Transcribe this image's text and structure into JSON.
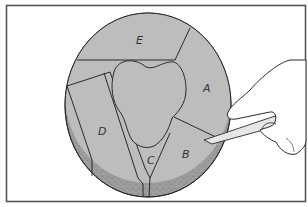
{
  "figure": {
    "type": "illustration",
    "colors": {
      "frame": "#555555",
      "cake_top": "#bdbdbd",
      "cake_rim": "#9c9c9c",
      "outline": "#2a2a2a",
      "knife": "#e6e6e6",
      "hand": "#ffffff"
    },
    "labels": {
      "a": "A",
      "b": "B",
      "c": "C",
      "d": "D",
      "e": "E"
    }
  }
}
